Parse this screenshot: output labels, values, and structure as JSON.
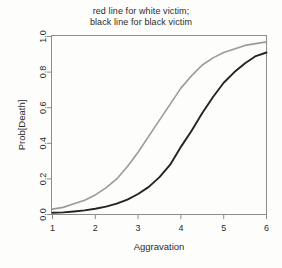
{
  "chart_data": {
    "type": "line",
    "title": "red line for white victim;\nblack line for black victim",
    "title_lines": [
      "red line for white victim;",
      "black line for black victim"
    ],
    "xlabel": "Aggravation",
    "ylabel": "Prob[Death]",
    "xlim": [
      1,
      6
    ],
    "ylim": [
      0,
      1
    ],
    "xticks": [
      1,
      2,
      3,
      4,
      5,
      6
    ],
    "xtick_labels": [
      "1",
      "2",
      "3",
      "4",
      "5",
      "6"
    ],
    "yticks": [
      0.0,
      0.2,
      0.4,
      0.6,
      0.8,
      1.0
    ],
    "ytick_labels": [
      "0.0",
      "0.2",
      "0.4",
      "0.6",
      "0.8",
      "1.0"
    ],
    "grid": false,
    "legend": "none (described in title)",
    "x": [
      1.0,
      1.25,
      1.5,
      1.75,
      2.0,
      2.25,
      2.5,
      2.75,
      3.0,
      3.25,
      3.5,
      3.75,
      4.0,
      4.25,
      4.5,
      4.75,
      5.0,
      5.25,
      5.5,
      5.75,
      6.0
    ],
    "series": [
      {
        "name": "red line for white victim",
        "color": "#9a9a9a",
        "rendered_as": "gray line (scanned red)",
        "values": [
          0.03,
          0.04,
          0.06,
          0.08,
          0.11,
          0.15,
          0.2,
          0.27,
          0.35,
          0.44,
          0.53,
          0.62,
          0.71,
          0.78,
          0.84,
          0.88,
          0.91,
          0.93,
          0.95,
          0.96,
          0.97
        ]
      },
      {
        "name": "black line for black victim",
        "color": "#232323",
        "rendered_as": "black line",
        "values": [
          0.01,
          0.012,
          0.017,
          0.023,
          0.032,
          0.044,
          0.061,
          0.084,
          0.115,
          0.155,
          0.21,
          0.28,
          0.38,
          0.47,
          0.57,
          0.66,
          0.74,
          0.8,
          0.85,
          0.89,
          0.91
        ]
      }
    ]
  },
  "colors": {
    "background": "#fdfdfb",
    "frame": "#8d8d8d",
    "text": "#2b2b2b",
    "white_victim_line": "#9a9a9a",
    "black_victim_line": "#232323"
  }
}
